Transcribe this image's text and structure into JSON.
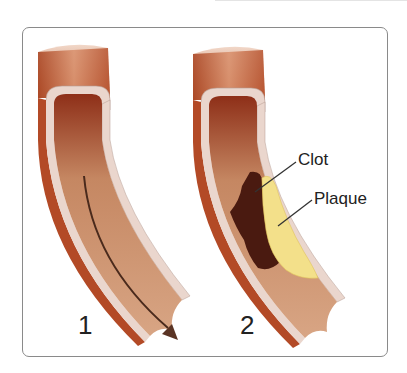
{
  "figure": {
    "panels": [
      {
        "number": "1",
        "description": "Normal artery with blood flow arrow"
      },
      {
        "number": "2",
        "description": "Artery with clot and plaque"
      }
    ],
    "labels": {
      "clot": "Clot",
      "plaque": "Plaque"
    },
    "colors": {
      "vessel_outer": "#b9532f",
      "vessel_wall": "#e9d4cc",
      "lumen": "#c98f6a",
      "clot": "#4a1a10",
      "plaque": "#f3e08a",
      "arrow": "#5a3424",
      "frame": "#8a8a8a"
    }
  }
}
